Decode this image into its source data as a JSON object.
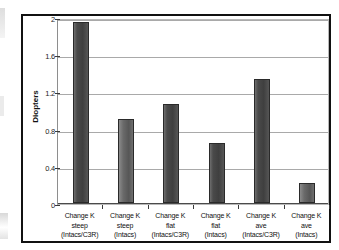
{
  "chart_data": {
    "type": "bar",
    "title": "",
    "xlabel": "",
    "ylabel": "Diopters",
    "ylim": [
      0,
      2
    ],
    "yticks": [
      "0",
      "0.4",
      "0.8",
      "1.2",
      "1.6",
      "2"
    ],
    "grid": true,
    "legend": "none",
    "categories": [
      "Change K steep (Intacs/C3R)",
      "Change K steep (Intacs)",
      "Change K flat (Intacs/C3R)",
      "Change K flat (Intacs)",
      "Change K ave (Intacs/C3R)",
      "Change K ave (Intacs)"
    ],
    "category_lines": [
      [
        "Change K",
        "steep",
        "(Intacs/C3R)"
      ],
      [
        "Change K",
        "steep",
        "(Intacs)"
      ],
      [
        "Change K",
        "flat",
        "(Intacs/C3R)"
      ],
      [
        "Change K",
        "flat",
        "(Intacs)"
      ],
      [
        "Change K",
        "ave",
        "(Intacs/C3R)"
      ],
      [
        "Change K",
        "ave",
        "(Intacs)"
      ]
    ],
    "values": [
      1.95,
      0.9,
      1.07,
      0.65,
      1.33,
      0.22
    ],
    "bar_color": "#4a4a4a",
    "bar_color_light": "#6a6a6a",
    "gridline_color": "#a9a9a9",
    "frame_color": "#111111"
  },
  "axis": {
    "y_title": "Diopters"
  }
}
